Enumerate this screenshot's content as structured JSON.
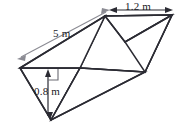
{
  "figure": {
    "kind": "triangular-prism-diagram",
    "colors": {
      "edge": "#2b2b33",
      "face": "#ffffff",
      "dimension_gray": "#8b8b93",
      "dimension_dark": "#2b2b33",
      "background": "#ffffff"
    },
    "dimensions": [
      {
        "id": "length",
        "label": "5 m",
        "orientation": "diagonal",
        "arrow": "double-headed",
        "color": "#8b8b93"
      },
      {
        "id": "width",
        "label": "1.2 m",
        "orientation": "horizontal",
        "arrow": "double-headed",
        "color": "#2b2b33"
      },
      {
        "id": "height",
        "label": "0.8 m",
        "orientation": "vertical",
        "arrow": "double-headed",
        "color": "#6a6a72"
      }
    ]
  }
}
